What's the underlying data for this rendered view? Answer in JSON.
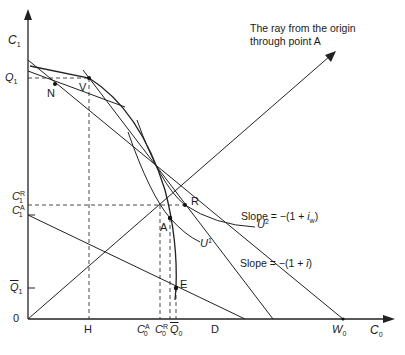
{
  "diagram": {
    "axes": {
      "y_label": "C",
      "y_label_sub": "1",
      "x_label": "C",
      "x_label_sub": "0",
      "origin_label": "0"
    },
    "y_ticks": {
      "q1": {
        "base": "Q",
        "sub": "1"
      },
      "c1r": {
        "base": "C",
        "sub": "1",
        "sup": "R"
      },
      "c1a": {
        "base": "C",
        "sub": "1",
        "sup": "A"
      },
      "q1bar": {
        "base": "Q",
        "sub": "1"
      }
    },
    "x_ticks": {
      "h": "H",
      "c0a": {
        "base": "C",
        "sub": "0",
        "sup": "A"
      },
      "c0r": {
        "base": "C",
        "sub": "0",
        "sup": "R"
      },
      "q0bar": {
        "base": "Q",
        "sub": "0"
      },
      "d": "D",
      "w0": {
        "base": "W",
        "sub": "0"
      }
    },
    "points": {
      "n": "N",
      "v": "V",
      "r": "R",
      "a": "A",
      "e": "E"
    },
    "curves": {
      "u2": {
        "base": "U",
        "sup": "2"
      },
      "u1": {
        "base": "U",
        "sup": "1"
      }
    },
    "annotations": {
      "ray_line1": "The ray from the origin",
      "ray_line2": "through point A",
      "slope_w_prefix": "Slope = −(1 + ",
      "slope_w_var": "i",
      "slope_w_sub": "w",
      "slope_w_suffix": ")",
      "slope_prefix": "Slope = −(1 + ",
      "slope_var": "ī",
      "slope_suffix": ")"
    }
  }
}
